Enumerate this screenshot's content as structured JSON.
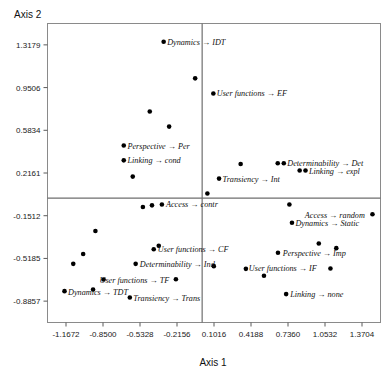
{
  "chart_data": {
    "type": "scatter",
    "title": "",
    "xlabel": "Axis 1",
    "ylabel": "Axis 2",
    "xlim": [
      -1.3258,
      1.529
    ],
    "ylim": [
      -1.0694,
      1.5016
    ],
    "grid": false,
    "legend": "none",
    "xticks": [
      "-1.1672",
      "-0.8500",
      "-0.5328",
      "-0.2156",
      "0.1016",
      "0.4188",
      "0.7360",
      "1.0532",
      "1.3704"
    ],
    "xtick_values": [
      -1.1672,
      -0.85,
      -0.5328,
      -0.2156,
      0.1016,
      0.4188,
      0.736,
      1.0532,
      1.3704
    ],
    "yticks": [
      "1.3179",
      "0.9506",
      "0.5834",
      "0.2161",
      "-0.1512",
      "-0.5185",
      "-0.8857"
    ],
    "ytick_values": [
      1.3179,
      0.9506,
      0.5834,
      0.2161,
      -0.1512,
      -0.5185,
      -0.8857
    ],
    "zero_lines": {
      "x": 0.0,
      "y": 0.0
    },
    "points": [
      {
        "label": "Dynamics → IDT",
        "x": -0.33,
        "y": 1.345,
        "label_pos": "right"
      },
      {
        "label": "",
        "x": -0.06,
        "y": 1.03,
        "label_pos": "none"
      },
      {
        "label": "User functions → EF",
        "x": 0.096,
        "y": 0.9,
        "label_pos": "right"
      },
      {
        "label": "",
        "x": -0.449,
        "y": 0.745,
        "label_pos": "none"
      },
      {
        "label": "",
        "x": -0.283,
        "y": 0.615,
        "label_pos": "none"
      },
      {
        "label": "Perspective → Per",
        "x": -0.672,
        "y": 0.452,
        "label_pos": "right"
      },
      {
        "label": "Linking → cond",
        "x": -0.672,
        "y": 0.325,
        "label_pos": "right"
      },
      {
        "label": "",
        "x": -0.595,
        "y": 0.185,
        "label_pos": "none"
      },
      {
        "label": "",
        "x": 0.33,
        "y": 0.293,
        "label_pos": "none"
      },
      {
        "label": "Determinability → Det",
        "x": 0.648,
        "y": 0.3,
        "label_pos": "right"
      },
      {
        "label": "",
        "x": 0.7,
        "y": 0.3,
        "label_pos": "none"
      },
      {
        "label": "Linking → expl",
        "x": 0.836,
        "y": 0.238,
        "label_pos": "right"
      },
      {
        "label": "",
        "x": 0.886,
        "y": 0.238,
        "label_pos": "none"
      },
      {
        "label": "Transiency → Int",
        "x": 0.145,
        "y": 0.168,
        "label_pos": "right"
      },
      {
        "label": "",
        "x": 0.045,
        "y": 0.04,
        "label_pos": "none"
      },
      {
        "label": "Access → contr",
        "x": -0.345,
        "y": -0.055,
        "label_pos": "right"
      },
      {
        "label": "",
        "x": -0.43,
        "y": -0.062,
        "label_pos": "none"
      },
      {
        "label": "",
        "x": 0.748,
        "y": -0.055,
        "label_pos": "none"
      },
      {
        "label": "Access → random",
        "x": 1.46,
        "y": -0.138,
        "label_pos": "left"
      },
      {
        "label": "Dynamics → Static",
        "x": 0.77,
        "y": -0.212,
        "label_pos": "right"
      },
      {
        "label": "",
        "x": -0.508,
        "y": -0.076,
        "label_pos": "none"
      },
      {
        "label": "",
        "x": -0.915,
        "y": -0.282,
        "label_pos": "none"
      },
      {
        "label": "",
        "x": 1.0,
        "y": -0.39,
        "label_pos": "none"
      },
      {
        "label": "Perspective → Imp",
        "x": 0.65,
        "y": -0.47,
        "label_pos": "right"
      },
      {
        "label": "",
        "x": 1.15,
        "y": -0.43,
        "label_pos": "none"
      },
      {
        "label": "User functions → CF",
        "x": -0.415,
        "y": -0.44,
        "label_pos": "right"
      },
      {
        "label": "",
        "x": -0.372,
        "y": -0.41,
        "label_pos": "none"
      },
      {
        "label": "Determinability → Ind",
        "x": -0.57,
        "y": -0.565,
        "label_pos": "right"
      },
      {
        "label": "",
        "x": -1.02,
        "y": -0.48,
        "label_pos": "none"
      },
      {
        "label": "",
        "x": -1.105,
        "y": -0.565,
        "label_pos": "none"
      },
      {
        "label": "User functions → IF",
        "x": 1.1,
        "y": -0.605,
        "label_pos": "left"
      },
      {
        "label": "",
        "x": 0.375,
        "y": -0.608,
        "label_pos": "none"
      },
      {
        "label": "",
        "x": 0.53,
        "y": -0.668,
        "label_pos": "none"
      },
      {
        "label": "",
        "x": 0.1,
        "y": -0.585,
        "label_pos": "none"
      },
      {
        "label": "User functions → TF",
        "x": -0.225,
        "y": -0.698,
        "label_pos": "none"
      },
      {
        "label": "",
        "x": -0.845,
        "y": -0.7,
        "label_pos": "none"
      },
      {
        "label": "Dynamics → TDT",
        "x": -1.18,
        "y": -0.8,
        "label_pos": "right"
      },
      {
        "label": "",
        "x": -0.935,
        "y": -0.785,
        "label_pos": "none"
      },
      {
        "label": "Transiency → Trans",
        "x": -0.62,
        "y": -0.855,
        "label_pos": "right"
      },
      {
        "label": "Linking → none",
        "x": 0.72,
        "y": -0.825,
        "label_pos": "right"
      }
    ],
    "labels": [
      {
        "text": "Dynamics → IDT",
        "x": -0.3,
        "y": 1.345
      },
      {
        "text": "User functions → EF",
        "x": 0.125,
        "y": 0.9
      },
      {
        "text": "Perspective → Per",
        "x": -0.64,
        "y": 0.452
      },
      {
        "text": "Linking → cond",
        "x": -0.64,
        "y": 0.325
      },
      {
        "text": "Determinability → Det",
        "x": 0.73,
        "y": 0.305
      },
      {
        "text": "Linking → expl",
        "x": 0.915,
        "y": 0.23
      },
      {
        "text": "Transiency → Int",
        "x": 0.175,
        "y": 0.168
      },
      {
        "text": "Access → contr",
        "x": -0.31,
        "y": -0.05
      },
      {
        "text": "Access → random",
        "x": 0.88,
        "y": -0.145
      },
      {
        "text": "Dynamics → Static",
        "x": 0.8,
        "y": -0.215
      },
      {
        "text": "Perspective → Imp",
        "x": 0.69,
        "y": -0.47
      },
      {
        "text": "User functions → CF",
        "x": -0.38,
        "y": -0.44
      },
      {
        "text": "Determinability → Ind",
        "x": -0.535,
        "y": -0.565
      },
      {
        "text": "User functions → IF",
        "x": 0.4,
        "y": -0.605
      },
      {
        "text": "User functions → TF",
        "x": -0.88,
        "y": -0.7
      },
      {
        "text": "Dynamics → TDT",
        "x": -1.15,
        "y": -0.805
      },
      {
        "text": "Transiency → Trans",
        "x": -0.59,
        "y": -0.86
      },
      {
        "text": "Linking → none",
        "x": 0.755,
        "y": -0.825
      }
    ]
  },
  "axes": {
    "x_title": "Axis 1",
    "y_title": "Axis 2"
  }
}
